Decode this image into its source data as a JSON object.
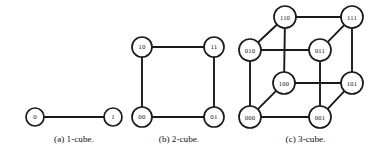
{
  "figure": {
    "background_color": "#ffffff",
    "line_color": "#1a1a1a",
    "node_fill": "#ffffff",
    "subfigures": [
      {
        "id": "a",
        "caption": "(a) 1-cube.",
        "node_radius": 9,
        "nodes": [
          {
            "label": "0",
            "cx": 35,
            "cy": 117
          },
          {
            "label": "1",
            "cx": 113,
            "cy": 117
          }
        ],
        "edges": [
          {
            "from": "0",
            "to": "1"
          }
        ]
      },
      {
        "id": "b",
        "caption": "(b) 2-cube.",
        "node_radius": 10,
        "nodes": [
          {
            "label": "10",
            "cx": 142,
            "cy": 47
          },
          {
            "label": "11",
            "cx": 214,
            "cy": 47
          },
          {
            "label": "00",
            "cx": 142,
            "cy": 117
          },
          {
            "label": "01",
            "cx": 214,
            "cy": 117
          }
        ],
        "edges": [
          {
            "from": "10",
            "to": "11"
          },
          {
            "from": "00",
            "to": "01"
          },
          {
            "from": "10",
            "to": "00"
          },
          {
            "from": "11",
            "to": "01"
          }
        ]
      },
      {
        "id": "c",
        "caption": "(c) 3-cube.",
        "node_radius": 11,
        "nodes": [
          {
            "label": "110",
            "cx": 285,
            "cy": 17
          },
          {
            "label": "111",
            "cx": 352,
            "cy": 17
          },
          {
            "label": "010",
            "cx": 250,
            "cy": 50
          },
          {
            "label": "011",
            "cx": 320,
            "cy": 50
          },
          {
            "label": "100",
            "cx": 284,
            "cy": 83
          },
          {
            "label": "101",
            "cx": 352,
            "cy": 83
          },
          {
            "label": "000",
            "cx": 250,
            "cy": 117
          },
          {
            "label": "001",
            "cx": 320,
            "cy": 117
          }
        ],
        "edges": [
          {
            "from": "110",
            "to": "111"
          },
          {
            "from": "010",
            "to": "011"
          },
          {
            "from": "100",
            "to": "101"
          },
          {
            "from": "000",
            "to": "001"
          },
          {
            "from": "110",
            "to": "010"
          },
          {
            "from": "111",
            "to": "011"
          },
          {
            "from": "100",
            "to": "000"
          },
          {
            "from": "101",
            "to": "001"
          },
          {
            "from": "110",
            "to": "100"
          },
          {
            "from": "111",
            "to": "101"
          },
          {
            "from": "010",
            "to": "000"
          },
          {
            "from": "011",
            "to": "001"
          }
        ]
      }
    ]
  }
}
